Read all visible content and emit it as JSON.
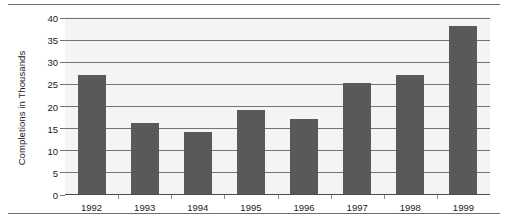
{
  "chart_data": {
    "type": "bar",
    "title": "",
    "xlabel": "",
    "ylabel": "Completions in Thousands",
    "categories": [
      "1992",
      "1993",
      "1994",
      "1995",
      "1996",
      "1997",
      "1998",
      "1999"
    ],
    "values": [
      27,
      16,
      14,
      19,
      17,
      25,
      27,
      38
    ],
    "ylim": [
      0,
      40
    ],
    "yticks": [
      0,
      5,
      10,
      15,
      20,
      25,
      30,
      35,
      40
    ],
    "ytick_labels": [
      "0",
      "5",
      "10",
      "15",
      "20",
      "25",
      "30",
      "35",
      "40"
    ],
    "grid": true,
    "grid_axis": "y",
    "legend": false,
    "bar_color": "#595959",
    "plot_background": "#f4f4f4",
    "gridline_color": "#737373",
    "text_color": "#1a1a1a"
  }
}
